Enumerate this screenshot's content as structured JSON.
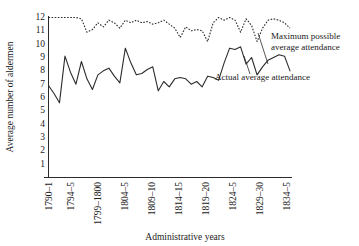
{
  "chart_data": {
    "type": "line",
    "title": "",
    "xlabel": "Administrative years",
    "ylabel": "Average number of aldermen",
    "ylim": [
      0,
      12
    ],
    "yticks": [
      1,
      2,
      3,
      4,
      5,
      6,
      7,
      8,
      9,
      10,
      11,
      12
    ],
    "grid": false,
    "legend_position": "annotations-on-plot",
    "xlim": [
      1790,
      1834
    ],
    "xtick_labels": [
      "1790–1",
      "1794–5",
      "1799–1800",
      "1804–5",
      "1809–10",
      "1814–15",
      "1819–20",
      "1824–5",
      "1829–30",
      "1834–5"
    ],
    "xtick_years": [
      1790,
      1794,
      1799,
      1804,
      1809,
      1814,
      1819,
      1824,
      1829,
      1834
    ],
    "x": [
      1790,
      1791,
      1792,
      1793,
      1794,
      1795,
      1796,
      1797,
      1798,
      1799,
      1800,
      1801,
      1802,
      1803,
      1804,
      1805,
      1806,
      1807,
      1808,
      1809,
      1810,
      1811,
      1812,
      1813,
      1814,
      1815,
      1816,
      1817,
      1818,
      1819,
      1820,
      1821,
      1822,
      1823,
      1824,
      1825,
      1826,
      1827,
      1828,
      1829,
      1830,
      1831,
      1832,
      1833,
      1834
    ],
    "series": [
      {
        "name": "Maximum possible average attendance",
        "style": "dotted",
        "values": [
          12.0,
          12.0,
          12.0,
          12.0,
          12.0,
          12.0,
          11.9,
          10.9,
          11.1,
          11.6,
          11.3,
          11.8,
          11.6,
          11.2,
          11.8,
          11.6,
          11.8,
          11.6,
          11.7,
          11.5,
          11.6,
          11.8,
          11.5,
          11.2,
          10.5,
          11.3,
          11.0,
          11.1,
          11.0,
          10.2,
          11.6,
          12.0,
          11.8,
          12.0,
          11.8,
          10.9,
          11.9,
          11.4,
          10.2,
          11.2,
          11.8,
          11.9,
          11.8,
          11.6,
          11.2
        ]
      },
      {
        "name": "Actual average attendance",
        "style": "solid",
        "values": [
          6.9,
          6.3,
          5.6,
          9.1,
          7.9,
          7.0,
          8.7,
          7.4,
          6.6,
          7.7,
          8.0,
          8.2,
          7.6,
          7.1,
          9.7,
          8.6,
          7.7,
          7.8,
          8.1,
          8.3,
          6.5,
          7.2,
          6.8,
          7.4,
          7.5,
          7.4,
          7.0,
          7.2,
          6.8,
          7.6,
          7.5,
          7.3,
          8.6,
          9.7,
          9.6,
          9.8,
          8.5,
          9.0,
          7.7,
          8.3,
          8.8,
          9.0,
          9.2,
          9.1,
          8.0
        ]
      }
    ],
    "annotations": [
      {
        "name": "max-possible-label",
        "line1": "Maximum possible",
        "line2": "average attendance"
      },
      {
        "name": "actual-label",
        "text": "Actual average attendance"
      }
    ]
  }
}
